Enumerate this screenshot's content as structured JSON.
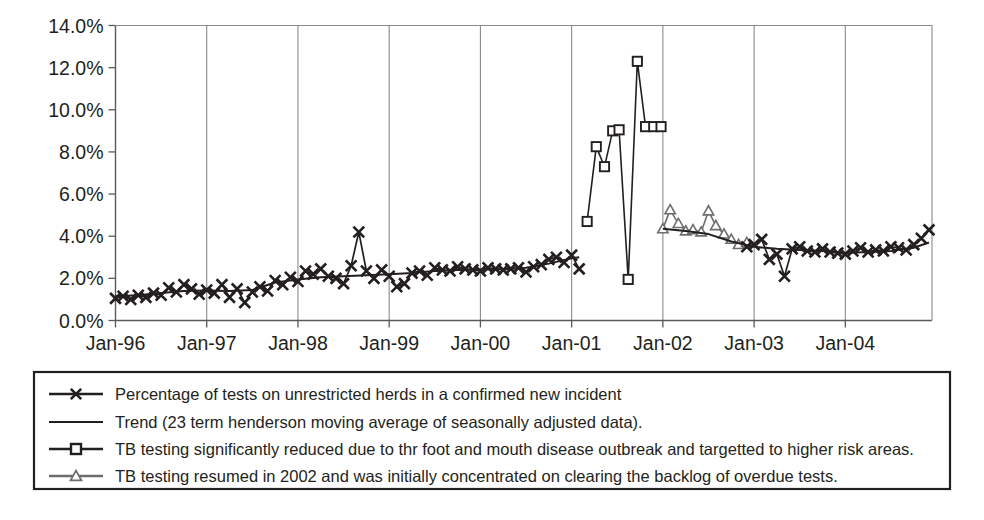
{
  "chart_data": {
    "type": "line",
    "title": "",
    "subtitle": "",
    "xlabel": "",
    "ylabel": "",
    "ylim": [
      0,
      14
    ],
    "xlim": [
      1996.0,
      2004.95
    ],
    "grid": true,
    "y_tick_labels": [
      "0.0%",
      "2.0%",
      "4.0%",
      "6.0%",
      "8.0%",
      "10.0%",
      "12.0%",
      "14.0%"
    ],
    "y_tick_values": [
      0,
      2,
      4,
      6,
      8,
      10,
      12,
      14
    ],
    "x_tick_labels": [
      "Jan-96",
      "Jan-97",
      "Jan-98",
      "Jan-99",
      "Jan-00",
      "Jan-01",
      "Jan-02",
      "Jan-03",
      "Jan-04"
    ],
    "x_tick_values": [
      1996,
      1997,
      1998,
      1999,
      2000,
      2001,
      2002,
      2003,
      2004
    ],
    "legend_position": "below-plot",
    "colors": {
      "main_series": "#231f20",
      "trend": "#231f20",
      "fmd_series": "#231f20",
      "resumed_series": "#6e6e6e",
      "axis": "#5a5a5a",
      "grid": "#8a8a8a",
      "text": "#231f20"
    },
    "series": [
      {
        "name": "Percentage of tests on unrestricted herds in a confirmed new incident",
        "marker": "x",
        "color": "#231f20",
        "x": [
          1996.0,
          1996.083,
          1996.167,
          1996.25,
          1996.333,
          1996.417,
          1996.5,
          1996.583,
          1996.667,
          1996.75,
          1996.833,
          1996.917,
          1997.0,
          1997.083,
          1997.167,
          1997.25,
          1997.333,
          1997.417,
          1997.5,
          1997.583,
          1997.667,
          1997.75,
          1997.833,
          1997.917,
          1998.0,
          1998.083,
          1998.167,
          1998.25,
          1998.333,
          1998.417,
          1998.5,
          1998.583,
          1998.667,
          1998.75,
          1998.833,
          1998.917,
          1999.0,
          1999.083,
          1999.167,
          1999.25,
          1999.333,
          1999.417,
          1999.5,
          1999.583,
          1999.667,
          1999.75,
          1999.833,
          1999.917,
          2000.0,
          2000.083,
          2000.167,
          2000.25,
          2000.333,
          2000.417,
          2000.5,
          2000.583,
          2000.667,
          2000.75,
          2000.833,
          2000.917,
          2001.0,
          2001.083
        ],
        "y": [
          1.05,
          1.15,
          1.0,
          1.2,
          1.1,
          1.3,
          1.2,
          1.55,
          1.35,
          1.7,
          1.5,
          1.25,
          1.45,
          1.3,
          1.7,
          1.1,
          1.5,
          0.85,
          1.35,
          1.6,
          1.4,
          1.9,
          1.7,
          2.05,
          1.85,
          2.35,
          2.2,
          2.45,
          2.1,
          2.0,
          1.75,
          2.6,
          4.2,
          2.35,
          2.0,
          2.4,
          2.1,
          1.6,
          1.75,
          2.25,
          2.35,
          2.15,
          2.5,
          2.4,
          2.35,
          2.55,
          2.45,
          2.4,
          2.35,
          2.5,
          2.45,
          2.4,
          2.45,
          2.5,
          2.3,
          2.55,
          2.65,
          2.9,
          3.0,
          2.75,
          3.1,
          2.45
        ]
      },
      {
        "name": "Trend (23 term henderson moving average of seasonally adjusted data).",
        "marker": "none",
        "color": "#231f20",
        "x": [
          1996.0,
          1996.25,
          1996.5,
          1996.75,
          1997.0,
          1997.25,
          1997.5,
          1997.75,
          1998.0,
          1998.25,
          1998.5,
          1998.75,
          1999.0,
          1999.25,
          1999.5,
          1999.75,
          2000.0,
          2000.25,
          2000.5,
          2000.75,
          2001.0,
          2001.083
        ],
        "y": [
          1.15,
          1.2,
          1.3,
          1.4,
          1.42,
          1.4,
          1.45,
          1.8,
          1.95,
          2.05,
          2.1,
          2.15,
          2.2,
          2.25,
          2.35,
          2.4,
          2.42,
          2.44,
          2.5,
          2.7,
          2.95,
          3.0
        ]
      },
      {
        "name": "TB testing significantly reduced due to thr foot and mouth disease outbreak and targetted to higher risk areas.",
        "marker": "square",
        "color": "#231f20",
        "x": [
          2001.17,
          2001.27,
          2001.36,
          2001.45,
          2001.52,
          2001.62,
          2001.72,
          2001.81,
          2001.9,
          2001.98
        ],
        "y": [
          4.7,
          8.25,
          7.3,
          9.0,
          9.05,
          1.95,
          12.3,
          9.2,
          9.2,
          9.2
        ]
      },
      {
        "name": "TB testing resumed in 2002 and was initially concentrated on clearing the backlog of overdue tests.",
        "marker": "triangle",
        "color": "#6e6e6e",
        "x": [
          2002.0,
          2002.08,
          2002.17,
          2002.25,
          2002.33,
          2002.42,
          2002.5,
          2002.58,
          2002.67,
          2002.75,
          2002.83,
          2002.92
        ],
        "y": [
          4.35,
          5.25,
          4.6,
          4.25,
          4.3,
          4.2,
          5.2,
          4.5,
          4.1,
          3.85,
          3.6,
          3.7
        ]
      },
      {
        "name": "Percentage of tests on unrestricted herds in a confirmed new incident (post-2002)",
        "marker": "x",
        "color": "#231f20",
        "x": [
          2002.92,
          2003.0,
          2003.083,
          2003.167,
          2003.25,
          2003.333,
          2003.417,
          2003.5,
          2003.583,
          2003.667,
          2003.75,
          2003.833,
          2003.917,
          2004.0,
          2004.083,
          2004.167,
          2004.25,
          2004.333,
          2004.417,
          2004.5,
          2004.583,
          2004.667,
          2004.75,
          2004.833,
          2004.917
        ],
        "y": [
          3.5,
          3.6,
          3.85,
          2.9,
          3.15,
          2.1,
          3.4,
          3.5,
          3.3,
          3.25,
          3.4,
          3.25,
          3.2,
          3.15,
          3.3,
          3.45,
          3.25,
          3.35,
          3.3,
          3.5,
          3.45,
          3.35,
          3.6,
          3.9,
          4.3
        ]
      },
      {
        "name": "Trend (post-2002)",
        "marker": "none",
        "color": "#231f20",
        "x": [
          2002.0,
          2002.25,
          2002.5,
          2002.75,
          2003.0,
          2003.25,
          2003.5,
          2003.75,
          2004.0,
          2004.25,
          2004.5,
          2004.75,
          2004.917
        ],
        "y": [
          4.35,
          4.25,
          4.1,
          3.75,
          3.5,
          3.4,
          3.35,
          3.3,
          3.2,
          3.25,
          3.3,
          3.45,
          3.7
        ]
      }
    ]
  },
  "legend": {
    "entries": [
      {
        "marker": "x-line",
        "label": "Percentage of tests on unrestricted herds in a confirmed new incident"
      },
      {
        "marker": "plain-line",
        "label": "Trend (23 term henderson moving average of seasonally adjusted data)."
      },
      {
        "marker": "square-line",
        "label": "TB testing significantly reduced due to thr foot and mouth disease outbreak and targetted to higher risk areas."
      },
      {
        "marker": "triangle-line",
        "label": "TB testing resumed in 2002 and was initially concentrated on clearing the backlog of overdue tests."
      }
    ]
  }
}
